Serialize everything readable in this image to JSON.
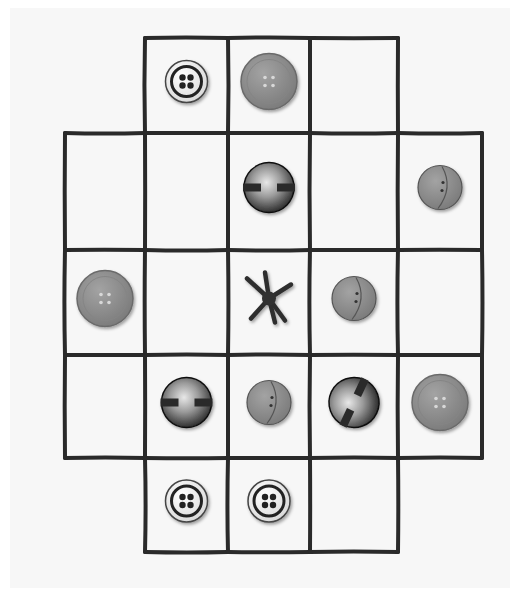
{
  "scene": {
    "description": "Hand-drawn cross-shaped grid with buttons placed in some cells",
    "colors": {
      "paper": "#f7f7f7",
      "ink": "#2a2a2a",
      "gray_button": "#8e8e8e",
      "white_button": "#f2f2f2",
      "dark_button": "#3a3a3a"
    }
  },
  "grid": {
    "columns": 5,
    "rows": 5,
    "active_cells": [
      [
        0,
        1
      ],
      [
        0,
        2
      ],
      [
        0,
        3
      ],
      [
        1,
        0
      ],
      [
        1,
        1
      ],
      [
        1,
        2
      ],
      [
        1,
        3
      ],
      [
        1,
        4
      ],
      [
        2,
        0
      ],
      [
        2,
        1
      ],
      [
        2,
        2
      ],
      [
        2,
        3
      ],
      [
        2,
        4
      ],
      [
        3,
        0
      ],
      [
        3,
        1
      ],
      [
        3,
        2
      ],
      [
        3,
        3
      ],
      [
        3,
        4
      ],
      [
        4,
        1
      ],
      [
        4,
        2
      ],
      [
        4,
        3
      ]
    ]
  },
  "pieces": [
    {
      "row": 0,
      "col": 1,
      "type": "white-four-hole"
    },
    {
      "row": 0,
      "col": 2,
      "type": "gray-four-hole"
    },
    {
      "row": 1,
      "col": 2,
      "type": "dark-shank-bar"
    },
    {
      "row": 1,
      "col": 4,
      "type": "gray-crescent-two-hole"
    },
    {
      "row": 2,
      "col": 0,
      "type": "gray-four-hole"
    },
    {
      "row": 2,
      "col": 2,
      "type": "thread-star"
    },
    {
      "row": 2,
      "col": 3,
      "type": "gray-crescent-two-hole"
    },
    {
      "row": 3,
      "col": 1,
      "type": "dark-shank-bar"
    },
    {
      "row": 3,
      "col": 2,
      "type": "gray-crescent-two-hole"
    },
    {
      "row": 3,
      "col": 3,
      "type": "dark-shank-bar-diagonal"
    },
    {
      "row": 3,
      "col": 4,
      "type": "gray-four-hole"
    },
    {
      "row": 4,
      "col": 1,
      "type": "white-four-hole"
    },
    {
      "row": 4,
      "col": 2,
      "type": "white-four-hole"
    }
  ]
}
